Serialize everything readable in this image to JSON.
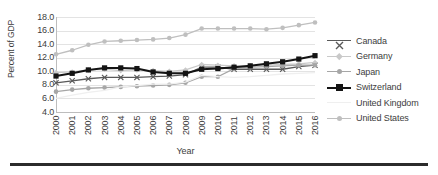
{
  "chart_data": {
    "type": "line",
    "title": "",
    "xlabel": "Year",
    "ylabel": "Percent of GDP",
    "grid": true,
    "legend_position": "right",
    "ylim": [
      4.0,
      18.0
    ],
    "yticks": [
      "4.0",
      "6.0",
      "8.0",
      "10.0",
      "12.0",
      "14.0",
      "16.0",
      "18.0"
    ],
    "ytick_values": [
      4.0,
      6.0,
      8.0,
      10.0,
      12.0,
      14.0,
      16.0,
      18.0
    ],
    "categories": [
      "2000",
      "2001",
      "2002",
      "2003",
      "2004",
      "2005",
      "2006",
      "2007",
      "2008",
      "2009",
      "2010",
      "2011",
      "2012",
      "2013",
      "2014",
      "2015",
      "2016"
    ],
    "x": [
      2000,
      2001,
      2002,
      2003,
      2004,
      2005,
      2006,
      2007,
      2008,
      2009,
      2010,
      2011,
      2012,
      2013,
      2014,
      2015,
      2016
    ],
    "series": [
      {
        "name": "Canada",
        "color": "#595959",
        "marker": "x",
        "values": [
          8.3,
          8.6,
          8.9,
          9.1,
          9.1,
          9.1,
          9.2,
          9.3,
          9.5,
          10.6,
          10.6,
          10.3,
          10.3,
          10.3,
          10.3,
          10.7,
          10.9
        ]
      },
      {
        "name": "Germany",
        "color": "#c9c9c9",
        "marker": "diamond",
        "values": [
          9.8,
          9.9,
          10.2,
          10.3,
          10.1,
          10.2,
          10.1,
          10.0,
          10.2,
          11.0,
          10.9,
          10.8,
          10.8,
          10.9,
          11.0,
          11.1,
          11.3
        ]
      },
      {
        "name": "Japan",
        "color": "#a6a6a6",
        "marker": "circle",
        "values": [
          7.0,
          7.3,
          7.5,
          7.6,
          7.7,
          7.8,
          7.9,
          8.0,
          8.3,
          9.2,
          9.2,
          10.4,
          10.6,
          10.7,
          10.8,
          10.9,
          10.9
        ]
      },
      {
        "name": "Switzerland",
        "color": "#141414",
        "marker": "square",
        "values": [
          9.3,
          9.7,
          10.2,
          10.5,
          10.5,
          10.4,
          9.9,
          9.7,
          9.7,
          10.3,
          10.4,
          10.6,
          10.8,
          11.1,
          11.4,
          11.8,
          12.3
        ]
      },
      {
        "name": "United Kingdom",
        "color": "#efefef",
        "marker": "none",
        "values": [
          6.0,
          6.5,
          6.9,
          7.2,
          7.7,
          7.9,
          8.1,
          8.1,
          8.4,
          9.4,
          9.2,
          9.1,
          9.2,
          9.4,
          9.6,
          9.7,
          9.8
        ]
      },
      {
        "name": "United States",
        "color": "#bfbfbf",
        "marker": "circle",
        "values": [
          12.5,
          13.1,
          13.9,
          14.4,
          14.5,
          14.6,
          14.7,
          14.9,
          15.4,
          16.3,
          16.3,
          16.3,
          16.3,
          16.2,
          16.4,
          16.8,
          17.2
        ]
      }
    ]
  },
  "axis": {
    "y_title": "Percent of GDP",
    "x_title": "Year"
  },
  "legend": {
    "items": [
      {
        "label": "Canada"
      },
      {
        "label": "Germany"
      },
      {
        "label": "Japan"
      },
      {
        "label": "Switzerland"
      },
      {
        "label": "United Kingdom"
      },
      {
        "label": "United States"
      }
    ]
  }
}
